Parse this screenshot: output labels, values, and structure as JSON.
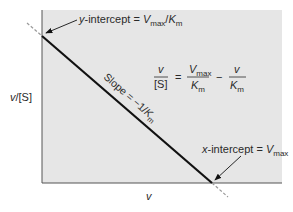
{
  "diagram": {
    "type": "eadie-hofstee-plot",
    "background_color": "#e6e6e6",
    "line_color": "#111111",
    "axes": {
      "ylabel": "v/[S]",
      "xlabel": "v"
    },
    "annotations": {
      "y_intercept": {
        "prefix": "y",
        "text": "-intercept = ",
        "V": "V",
        "Vsub": "max",
        "slash": "/",
        "K": "K",
        "Ksub": "m"
      },
      "x_intercept": {
        "prefix": "x",
        "text": "-intercept = ",
        "V": "V",
        "Vsub": "max"
      },
      "slope": {
        "text": "Slope = −1/",
        "K": "K",
        "Ksub": "m"
      }
    },
    "equation": {
      "lhs_num": "v",
      "lhs_den": "[S]",
      "eq": "=",
      "t1_num_V": "V",
      "t1_num_sub": "max",
      "t1_den_K": "K",
      "t1_den_sub": "m",
      "minus": "−",
      "t2_num": "v",
      "t2_den_K": "K",
      "t2_den_sub": "m"
    }
  }
}
